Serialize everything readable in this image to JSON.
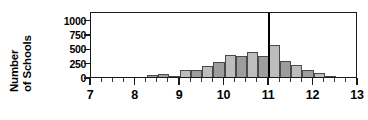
{
  "chart_data": {
    "type": "bar",
    "title": "",
    "subtitle": "",
    "xlabel": "",
    "ylabel": "Number of Schools",
    "ylabel_lines": [
      "Number",
      "of Schools"
    ],
    "xlim": [
      7,
      13
    ],
    "ylim": [
      0,
      1150
    ],
    "grid": false,
    "legend": null,
    "bar_width": 0.25,
    "y_ticks": [
      0,
      250,
      500,
      750,
      1000
    ],
    "y_tick_labels": [
      "0",
      "250",
      "500",
      "750",
      "1000"
    ],
    "x_ticks": [
      7,
      8,
      9,
      10,
      11,
      12,
      13
    ],
    "x_tick_labels": [
      "7",
      "8",
      "9",
      "10",
      "11",
      "12",
      "13"
    ],
    "x_minor_tick_step": 0.25,
    "bin_left_edges": [
      8.25,
      8.5,
      8.75,
      9.0,
      9.25,
      9.5,
      9.75,
      10.0,
      10.25,
      10.5,
      10.75,
      11.0,
      11.25,
      11.5,
      11.75,
      12.0,
      12.25
    ],
    "values": [
      30,
      45,
      20,
      120,
      130,
      195,
      260,
      380,
      370,
      440,
      360,
      555,
      280,
      215,
      120,
      70,
      10
    ],
    "bar_fill_colors": [
      "#9d9d9d",
      "#9d9d9d",
      "#9d9d9d",
      "#bdbdbd",
      "#9d9d9d",
      "#bdbdbd",
      "#9d9d9d",
      "#bdbdbd",
      "#9d9d9d",
      "#bdbdbd",
      "#9d9d9d",
      "#bdbdbd",
      "#9d9d9d",
      "#bdbdbd",
      "#9d9d9d",
      "#bdbdbd",
      "#9d9d9d"
    ],
    "bar_edge_color": "#4a4a4a",
    "annotations": [
      {
        "name": "reference-line",
        "type": "vline",
        "x": 11.0,
        "color": "#000000",
        "width_px": 2.6
      }
    ],
    "axis_color": "#1a1a1a",
    "background_color": "#ffffff"
  }
}
